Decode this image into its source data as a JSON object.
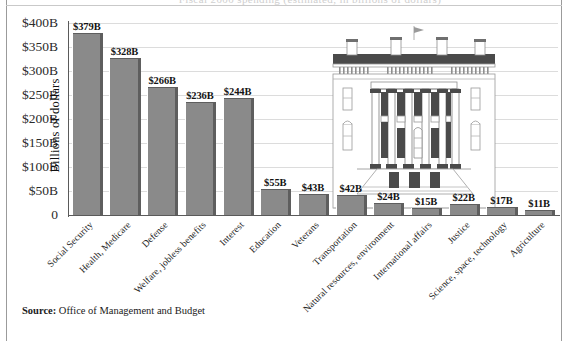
{
  "figure": {
    "cut_off_title": "Fiscal 2000 spending (estimated, in billions of dollars)",
    "source_label": "Source:",
    "source_text": "Office of Management and Budget",
    "illustration_name": "white-house-north-portico"
  },
  "chart_data": {
    "type": "bar",
    "title": "",
    "xlabel": "",
    "ylabel": "Billions of dollars",
    "ylim": [
      0,
      400
    ],
    "ytick_values": [
      0,
      50,
      100,
      150,
      200,
      250,
      300,
      350,
      400
    ],
    "ytick_labels": [
      "0",
      "$50B",
      "$100B",
      "$150B",
      "$200B",
      "$250B",
      "$300B",
      "$350B",
      "$400B"
    ],
    "grid": true,
    "legend": "none",
    "categories": [
      "Social Security",
      "Health, Medicare",
      "Defense",
      "Welfare, jobless benefits",
      "Interest",
      "Education",
      "Veterans",
      "Transportation",
      "Natural resources, environment",
      "International affairs",
      "Justice",
      "Science, space, technology",
      "Agriculture"
    ],
    "values": [
      379,
      328,
      266,
      236,
      244,
      55,
      43,
      42,
      24,
      15,
      22,
      17,
      11
    ],
    "value_labels": [
      "$379B",
      "$328B",
      "$266B",
      "$236B",
      "$244B",
      "$55B",
      "$43B",
      "$42B",
      "$24B",
      "$15B",
      "$22B",
      "$17B",
      "$11B"
    ],
    "bar_color": "#8a8a8a",
    "bar_edge_color": "#5e5e5e",
    "grid_color": "#dcdcdc",
    "axis_color": "#5a5a5a"
  }
}
